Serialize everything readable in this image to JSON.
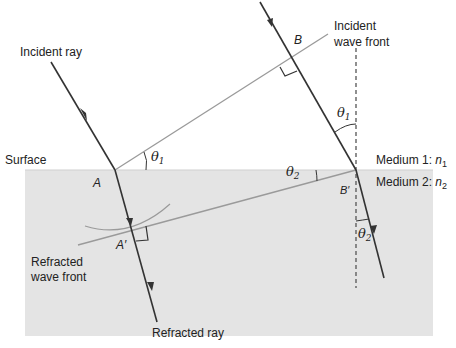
{
  "labels": {
    "incident_ray": "Incident ray",
    "incident_wave_front_1": "Incident",
    "incident_wave_front_2": "wave front",
    "surface": "Surface",
    "medium1": "Medium 1: ",
    "medium1_n": "n",
    "medium1_sub": "1",
    "medium2": "Medium 2: ",
    "medium2_n": "n",
    "medium2_sub": "2",
    "point_A": "A",
    "point_B": "B",
    "point_A_prime": "A′",
    "point_B_prime": "B′",
    "refracted_wave_front_1": "Refracted",
    "refracted_wave_front_2": "wave front",
    "refracted_ray": "Refracted ray",
    "theta": "θ",
    "sub1": "1",
    "sub2": "2"
  },
  "colors": {
    "medium2_fill": "#e4e4e4",
    "ray": "#333333",
    "wave_front": "#9a9a9a",
    "normal": "#555555"
  }
}
